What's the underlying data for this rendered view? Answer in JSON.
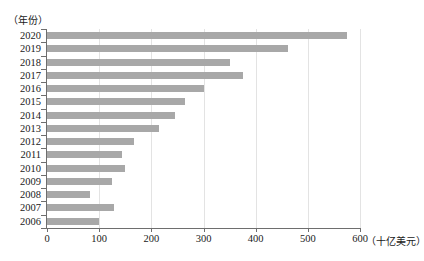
{
  "chart_data": {
    "type": "bar",
    "orientation": "horizontal",
    "title": "",
    "subtitle": "",
    "xlabel": "（十亿美元）",
    "ylabel": "（年份）",
    "categories": [
      "2020",
      "2019",
      "2018",
      "2017",
      "2016",
      "2015",
      "2014",
      "2013",
      "2012",
      "2011",
      "2010",
      "2009",
      "2008",
      "2007",
      "2006"
    ],
    "values": [
      575,
      462,
      350,
      375,
      300,
      265,
      245,
      215,
      167,
      144,
      150,
      125,
      83,
      128,
      100
    ],
    "series": [
      {
        "name": "",
        "values": [
          575,
          462,
          350,
          375,
          300,
          265,
          245,
          215,
          167,
          144,
          150,
          125,
          83,
          128,
          100
        ]
      }
    ],
    "xlim": [
      0,
      600
    ],
    "xticks": [
      0,
      100,
      200,
      300,
      400,
      500,
      600
    ],
    "xtick_labels": [
      "0",
      "100",
      "200",
      "300",
      "400",
      "500",
      "600"
    ],
    "grid": "vertical",
    "legend": "none",
    "bar_color": "#a8a8a8",
    "axis_color": "#6e6e6e",
    "gridline_color": "#e3e3e3"
  }
}
